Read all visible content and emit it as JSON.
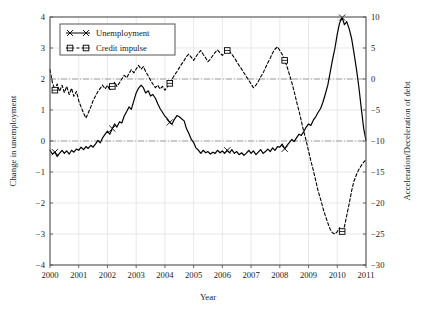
{
  "chart_data": {
    "type": "line",
    "title": "",
    "xlabel": "Year",
    "ylabel": "Change in unemployment",
    "y2label": "Acceleration/Deceleration of debt",
    "xlim": [
      2000,
      2011
    ],
    "ylim": [
      -4,
      4
    ],
    "y2lim": [
      -30,
      10
    ],
    "xticks": [
      "2000",
      "2001",
      "2002",
      "2003",
      "2004",
      "2005",
      "2006",
      "2007",
      "2008",
      "2009",
      "2010",
      "2011"
    ],
    "yticks": [
      "-4",
      "-3",
      "-2",
      "-1",
      "0",
      "1",
      "2",
      "3",
      "4"
    ],
    "y2ticks": [
      "-30",
      "-25",
      "-20",
      "-15",
      "-10",
      "-5",
      "0",
      "5",
      "10"
    ],
    "grid": true,
    "legend_position": "top-left",
    "reference_lines": [
      {
        "name": "credit-impulse-zero",
        "y2_value": 0,
        "left_value": 2,
        "style": "dash-dot"
      },
      {
        "name": "unemployment-zero",
        "left_value": 0,
        "y2_value": -10,
        "style": "dash-dot"
      }
    ],
    "series": [
      {
        "name": "Unemployment",
        "axis": "left",
        "marker": "x",
        "line": "solid",
        "color": "#000000",
        "x": [
          2000.0,
          2000.08,
          2000.17,
          2000.25,
          2000.33,
          2000.42,
          2000.5,
          2000.58,
          2000.67,
          2000.75,
          2000.83,
          2000.92,
          2001.0,
          2001.08,
          2001.17,
          2001.25,
          2001.33,
          2001.42,
          2001.5,
          2001.58,
          2001.67,
          2001.75,
          2001.83,
          2001.92,
          2002.0,
          2002.08,
          2002.17,
          2002.25,
          2002.33,
          2002.42,
          2002.5,
          2002.58,
          2002.67,
          2002.75,
          2002.83,
          2002.92,
          2003.0,
          2003.08,
          2003.17,
          2003.25,
          2003.33,
          2003.42,
          2003.5,
          2003.58,
          2003.67,
          2003.75,
          2003.83,
          2003.92,
          2004.0,
          2004.08,
          2004.17,
          2004.25,
          2004.33,
          2004.42,
          2004.5,
          2004.58,
          2004.67,
          2004.75,
          2004.83,
          2004.92,
          2005.0,
          2005.08,
          2005.17,
          2005.25,
          2005.33,
          2005.42,
          2005.5,
          2005.58,
          2005.67,
          2005.75,
          2005.83,
          2005.92,
          2006.0,
          2006.08,
          2006.17,
          2006.25,
          2006.33,
          2006.42,
          2006.5,
          2006.58,
          2006.67,
          2006.75,
          2006.83,
          2006.92,
          2007.0,
          2007.08,
          2007.17,
          2007.25,
          2007.33,
          2007.42,
          2007.5,
          2007.58,
          2007.67,
          2007.75,
          2007.83,
          2007.92,
          2008.0,
          2008.08,
          2008.17,
          2008.25,
          2008.33,
          2008.42,
          2008.5,
          2008.58,
          2008.67,
          2008.75,
          2008.83,
          2008.92,
          2009.0,
          2009.08,
          2009.17,
          2009.25,
          2009.33,
          2009.42,
          2009.5,
          2009.58,
          2009.67,
          2009.75,
          2009.83,
          2009.92,
          2010.0,
          2010.08,
          2010.17,
          2010.25,
          2010.33,
          2010.42,
          2010.5,
          2010.58,
          2010.67,
          2010.75,
          2010.83,
          2010.92,
          2011.0
        ],
        "y": [
          -0.3,
          -0.42,
          -0.36,
          -0.5,
          -0.4,
          -0.3,
          -0.4,
          -0.32,
          -0.42,
          -0.3,
          -0.36,
          -0.26,
          -0.3,
          -0.2,
          -0.28,
          -0.18,
          -0.24,
          -0.14,
          -0.2,
          -0.1,
          0.02,
          -0.06,
          0.1,
          0.22,
          0.32,
          0.22,
          0.4,
          0.55,
          0.45,
          0.62,
          0.58,
          0.8,
          0.95,
          1.1,
          1.02,
          1.3,
          1.55,
          1.7,
          1.8,
          1.72,
          1.55,
          1.62,
          1.45,
          1.5,
          1.38,
          1.2,
          1.05,
          0.92,
          0.8,
          0.72,
          0.6,
          0.55,
          0.7,
          0.82,
          0.78,
          0.72,
          0.65,
          0.4,
          0.25,
          0.05,
          -0.05,
          -0.22,
          -0.3,
          -0.4,
          -0.3,
          -0.38,
          -0.34,
          -0.42,
          -0.36,
          -0.4,
          -0.3,
          -0.38,
          -0.32,
          -0.4,
          -0.3,
          -0.38,
          -0.28,
          -0.4,
          -0.34,
          -0.44,
          -0.38,
          -0.46,
          -0.4,
          -0.3,
          -0.4,
          -0.32,
          -0.44,
          -0.36,
          -0.28,
          -0.4,
          -0.34,
          -0.26,
          -0.34,
          -0.22,
          -0.3,
          -0.18,
          -0.2,
          -0.1,
          -0.25,
          -0.14,
          -0.05,
          0.05,
          -0.02,
          0.1,
          0.22,
          0.18,
          0.3,
          0.45,
          0.55,
          0.5,
          0.68,
          0.78,
          0.92,
          1.05,
          1.25,
          1.5,
          1.8,
          2.2,
          2.6,
          3.0,
          3.45,
          3.8,
          3.98,
          3.75,
          3.85,
          3.6,
          3.3,
          2.85,
          2.3,
          1.75,
          1.1,
          0.4,
          0.02
        ]
      },
      {
        "name": "Credit impulse",
        "axis": "right",
        "marker": "square",
        "line": "dashed",
        "color": "#000000",
        "x": [
          2000.0,
          2000.08,
          2000.17,
          2000.25,
          2000.33,
          2000.42,
          2000.5,
          2000.58,
          2000.67,
          2000.75,
          2000.83,
          2000.92,
          2001.0,
          2001.08,
          2001.17,
          2001.25,
          2001.33,
          2001.42,
          2001.5,
          2001.58,
          2001.67,
          2001.75,
          2001.83,
          2001.92,
          2002.0,
          2002.08,
          2002.17,
          2002.25,
          2002.33,
          2002.42,
          2002.5,
          2002.58,
          2002.67,
          2002.75,
          2002.83,
          2002.92,
          2003.0,
          2003.08,
          2003.17,
          2003.25,
          2003.33,
          2003.42,
          2003.5,
          2003.58,
          2003.67,
          2003.75,
          2003.83,
          2003.92,
          2004.0,
          2004.08,
          2004.17,
          2004.25,
          2004.33,
          2004.42,
          2004.5,
          2004.58,
          2004.67,
          2004.75,
          2004.83,
          2004.92,
          2005.0,
          2005.08,
          2005.17,
          2005.25,
          2005.33,
          2005.42,
          2005.5,
          2005.58,
          2005.67,
          2005.75,
          2005.83,
          2005.92,
          2006.0,
          2006.08,
          2006.17,
          2006.25,
          2006.33,
          2006.42,
          2006.5,
          2006.58,
          2006.67,
          2006.75,
          2006.83,
          2006.92,
          2007.0,
          2007.08,
          2007.17,
          2007.25,
          2007.33,
          2007.42,
          2007.5,
          2007.58,
          2007.67,
          2007.75,
          2007.83,
          2007.92,
          2008.0,
          2008.08,
          2008.17,
          2008.25,
          2008.33,
          2008.42,
          2008.5,
          2008.58,
          2008.67,
          2008.75,
          2008.83,
          2008.92,
          2009.0,
          2009.08,
          2009.17,
          2009.25,
          2009.33,
          2009.42,
          2009.5,
          2009.58,
          2009.67,
          2009.75,
          2009.83,
          2009.92,
          2010.0,
          2010.08,
          2010.17,
          2010.25,
          2010.33,
          2010.42,
          2010.5,
          2010.58,
          2010.67,
          2010.75,
          2010.83,
          2010.92,
          2011.0
        ],
        "y2": [
          1.5,
          -0.5,
          -1.8,
          -0.8,
          -2.0,
          -1.0,
          -2.2,
          -1.2,
          -2.5,
          -1.5,
          -2.8,
          -2.0,
          -3.5,
          -4.5,
          -5.5,
          -6.3,
          -5.5,
          -4.5,
          -3.5,
          -2.8,
          -2.0,
          -1.5,
          -1.0,
          -1.6,
          -1.0,
          -1.8,
          -1.2,
          -0.5,
          -1.2,
          -0.6,
          0.0,
          0.6,
          0.2,
          0.9,
          1.5,
          1.0,
          1.6,
          2.2,
          1.6,
          2.0,
          1.2,
          0.5,
          -0.2,
          -0.8,
          -1.4,
          -1.0,
          -1.6,
          -1.2,
          -1.8,
          -1.3,
          -0.7,
          0.0,
          0.6,
          1.2,
          1.8,
          2.4,
          3.0,
          3.6,
          4.0,
          3.5,
          3.0,
          3.6,
          4.2,
          4.6,
          4.0,
          3.4,
          2.8,
          3.2,
          3.8,
          4.3,
          4.7,
          4.2,
          3.8,
          4.2,
          4.6,
          4.4,
          4.0,
          3.4,
          2.8,
          2.2,
          1.6,
          1.0,
          0.4,
          -0.2,
          -0.8,
          -1.4,
          -1.0,
          -0.4,
          0.3,
          1.0,
          1.8,
          2.6,
          3.4,
          4.2,
          4.8,
          5.2,
          4.6,
          4.0,
          3.0,
          2.0,
          0.8,
          -0.6,
          -2.0,
          -3.6,
          -5.2,
          -6.8,
          -8.4,
          -10.0,
          -11.6,
          -13.2,
          -14.8,
          -16.4,
          -18.0,
          -19.4,
          -20.8,
          -22.0,
          -23.2,
          -24.2,
          -24.8,
          -25.0,
          -24.6,
          -24.0,
          -24.6,
          -23.8,
          -22.0,
          -20.0,
          -18.0,
          -16.5,
          -15.4,
          -14.6,
          -14.0,
          -13.4,
          -13.0
        ]
      }
    ],
    "legend": [
      {
        "label": "Unemployment",
        "marker": "x",
        "line": "solid"
      },
      {
        "label": "Credit impulse",
        "marker": "square",
        "line": "dashed"
      }
    ]
  }
}
